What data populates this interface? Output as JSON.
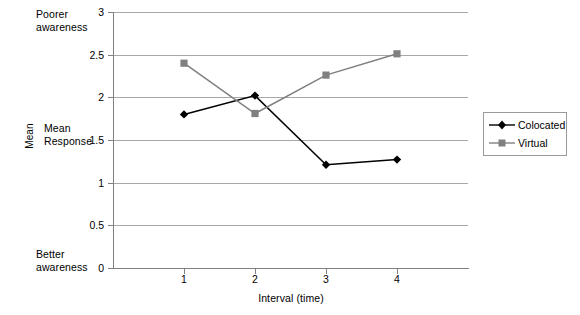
{
  "chart_data": {
    "type": "line",
    "title": "",
    "xlabel": "Interval (time)",
    "ylabel": "Mean",
    "x": [
      1,
      2,
      3,
      4
    ],
    "categories": [
      "1",
      "2",
      "3",
      "4"
    ],
    "series": [
      {
        "name": "Colocated",
        "values": [
          1.8,
          2.02,
          1.21,
          1.27
        ],
        "color": "#000000",
        "marker": "diamond"
      },
      {
        "name": "Virtual",
        "values": [
          2.4,
          1.81,
          2.26,
          2.51
        ],
        "color": "#808080",
        "marker": "square"
      }
    ],
    "ylim": [
      0,
      3
    ],
    "yticks": [
      "0",
      "0.5",
      "1",
      "1.5",
      "2",
      "2.5",
      "3"
    ],
    "ytick_values": [
      0,
      0.5,
      1,
      1.5,
      2,
      2.5,
      3
    ],
    "xticks": [
      "1",
      "2",
      "3",
      "4"
    ],
    "grid": "horizontal",
    "legend_position": "right-outside",
    "annotations": [
      {
        "name": "poorer-awareness",
        "text": "Poorer\nawareness",
        "at_value": 3
      },
      {
        "name": "mean-response",
        "text": "Mean\nResponse",
        "at_value": 1.5
      },
      {
        "name": "better-awareness",
        "text": "Better\nawareness",
        "at_value": 0
      }
    ]
  },
  "axis": {
    "y_title": "Mean",
    "x_title": "Interval (time)"
  },
  "annotations": {
    "poorer": "Poorer\nawareness",
    "mean_response": "Mean\nResponse",
    "better": "Better\nawareness"
  },
  "legend": {
    "entries": [
      {
        "label": "Colocated"
      },
      {
        "label": "Virtual"
      }
    ]
  },
  "colors": {
    "colocated": "#000000",
    "virtual": "#808080",
    "gridline": "#a8a8a8",
    "axis": "#808080",
    "background": "#ffffff"
  }
}
